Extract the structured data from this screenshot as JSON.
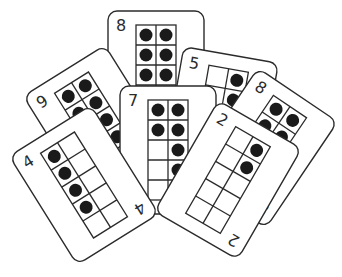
{
  "illustration": {
    "title": "Ten-frame number cards",
    "colors": {
      "background": "#ffffff",
      "outline": "#2b2b2b",
      "counter": "#1a1a1a"
    },
    "cards": [
      {
        "id": "card-8-back",
        "label": "8",
        "count": 8,
        "cx": 156,
        "cy": 75,
        "rot": 0,
        "show_bottom_label": false
      },
      {
        "id": "card-9",
        "label": "9",
        "count": 9,
        "cx": 98,
        "cy": 125,
        "rot": -32,
        "show_bottom_label": false
      },
      {
        "id": "card-5",
        "label": "5",
        "count": 5,
        "cx": 220,
        "cy": 118,
        "rot": 10,
        "show_bottom_label": false
      },
      {
        "id": "card-8-right",
        "label": "8",
        "count": 8,
        "cx": 262,
        "cy": 148,
        "rot": 34,
        "show_bottom_label": true
      },
      {
        "id": "card-7",
        "label": "7",
        "count": 7,
        "cx": 168,
        "cy": 150,
        "rot": 0,
        "show_bottom_label": false
      },
      {
        "id": "card-4",
        "label": "4",
        "count": 4,
        "cx": 84,
        "cy": 185,
        "rot": -32,
        "show_bottom_label": true
      },
      {
        "id": "card-2",
        "label": "2",
        "count": 2,
        "cx": 228,
        "cy": 180,
        "rot": 30,
        "show_bottom_label": true
      }
    ]
  }
}
